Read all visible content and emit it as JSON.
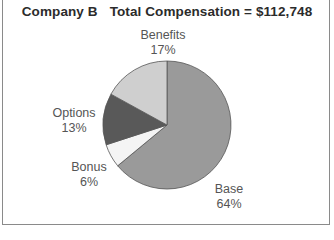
{
  "chart_data": {
    "type": "pie",
    "title": "Company B",
    "subtitle": "Total Compensation = $112,748",
    "total": 112748,
    "slices": [
      {
        "label": "Base",
        "percent": 64,
        "color": "#9a9a9a"
      },
      {
        "label": "Bonus",
        "percent": 6,
        "color": "#f4f4f4"
      },
      {
        "label": "Options",
        "percent": 13,
        "color": "#595959"
      },
      {
        "label": "Benefits",
        "percent": 17,
        "color": "#cfcfcf"
      }
    ],
    "start_angle_deg": 0,
    "direction": "clockwise",
    "legend": "none",
    "data_labels": "outside"
  },
  "labels": {
    "base_name": "Base",
    "base_pct": "64%",
    "bonus_name": "Bonus",
    "bonus_pct": "6%",
    "options_name": "Options",
    "options_pct": "13%",
    "benefits_name": "Benefits",
    "benefits_pct": "17%"
  }
}
